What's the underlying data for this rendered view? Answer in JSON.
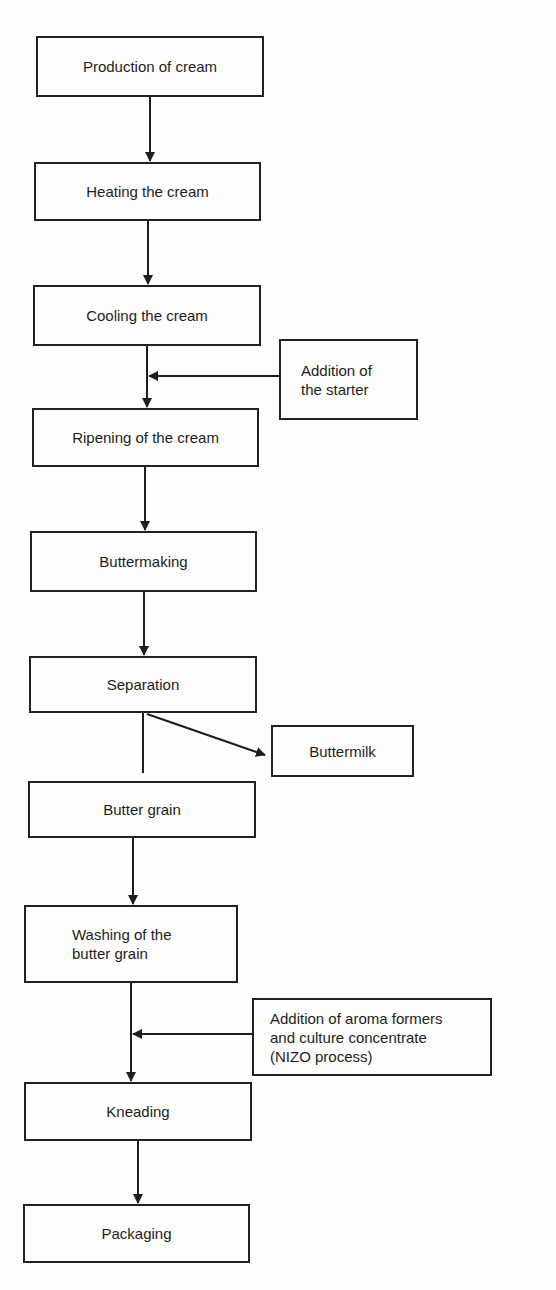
{
  "diagram": {
    "type": "process-flowchart",
    "main_steps": [
      {
        "id": "production",
        "label": "Production of cream"
      },
      {
        "id": "heating",
        "label": "Heating the cream"
      },
      {
        "id": "cooling",
        "label": "Cooling the cream"
      },
      {
        "id": "ripening",
        "label": "Ripening of the cream"
      },
      {
        "id": "buttermaking",
        "label": "Buttermaking"
      },
      {
        "id": "separation",
        "label": "Separation"
      },
      {
        "id": "butter_grain",
        "label": "Butter grain"
      },
      {
        "id": "washing",
        "label": "Washing of the\nbutter grain"
      },
      {
        "id": "kneading",
        "label": "Kneading"
      },
      {
        "id": "packaging",
        "label": "Packaging"
      }
    ],
    "side_inputs": [
      {
        "id": "starter",
        "label": "Addition of\nthe starter",
        "joins_between": [
          "cooling",
          "ripening"
        ]
      },
      {
        "id": "nizo",
        "label": "Addition of aroma formers\nand culture concentrate\n(NIZO process)",
        "joins_between": [
          "washing",
          "kneading"
        ]
      }
    ],
    "side_outputs": [
      {
        "id": "buttermilk",
        "label": "Buttermilk",
        "from": "separation"
      }
    ],
    "edges": [
      [
        "production",
        "heating"
      ],
      [
        "heating",
        "cooling"
      ],
      [
        "cooling",
        "ripening"
      ],
      [
        "starter",
        "cooling-ripening-line"
      ],
      [
        "ripening",
        "buttermaking"
      ],
      [
        "buttermaking",
        "separation"
      ],
      [
        "separation",
        "buttermilk"
      ],
      [
        "separation",
        "butter_grain"
      ],
      [
        "butter_grain",
        "washing"
      ],
      [
        "washing",
        "kneading"
      ],
      [
        "nizo",
        "washing-kneading-line"
      ],
      [
        "kneading",
        "packaging"
      ]
    ]
  }
}
